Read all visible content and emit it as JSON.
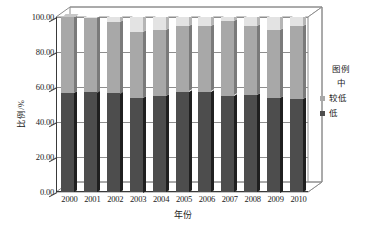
{
  "chart_data": {
    "type": "bar",
    "subtype": "stacked-percentage-3d",
    "title": "",
    "xlabel": "年份",
    "ylabel": "比例/%",
    "categories": [
      "2000",
      "2001",
      "2002",
      "2003",
      "2004",
      "2005",
      "2006",
      "2007",
      "2008",
      "2009",
      "2010"
    ],
    "ylim": [
      0,
      100
    ],
    "yticks": [
      "0.00",
      "20.00",
      "40.00",
      "60.00",
      "80.00",
      "100.00"
    ],
    "ytick_values": [
      0,
      20,
      40,
      60,
      80,
      100
    ],
    "grid": true,
    "legend_position": "right",
    "series": [
      {
        "name": "低",
        "color": "#4d4d4d",
        "values": [
          56.8,
          57.0,
          56.3,
          54.0,
          54.6,
          57.3,
          57.2,
          55.0,
          55.3,
          54.0,
          53.2
        ]
      },
      {
        "name": "较低",
        "color": "#a8a8a8",
        "values": [
          43.2,
          42.6,
          41.0,
          37.7,
          37.9,
          37.4,
          37.4,
          42.5,
          39.4,
          38.8,
          41.6
        ]
      },
      {
        "name": "中",
        "color": "#e3e3e3",
        "values": [
          0.0,
          0.4,
          2.7,
          8.3,
          7.5,
          5.3,
          5.4,
          2.5,
          5.3,
          7.2,
          5.2
        ]
      }
    ]
  },
  "legend": {
    "title": "图例",
    "entries": [
      {
        "label": "中",
        "color": "#e3e3e3",
        "swatch": false
      },
      {
        "label": "较低",
        "color": "#a8a8a8",
        "swatch": true
      },
      {
        "label": "低",
        "color": "#4d4d4d",
        "swatch": true
      }
    ]
  },
  "axes": {
    "x_title": "年份",
    "y_title": "比例/%"
  }
}
